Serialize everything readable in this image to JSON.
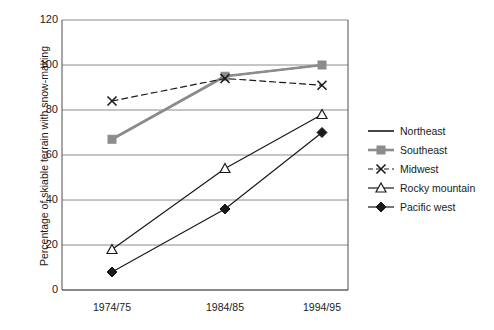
{
  "chart_data": {
    "type": "line",
    "title": "",
    "xlabel": "",
    "ylabel": "Percentage of skiable terrain with snow-making",
    "categories": [
      "1974/75",
      "1984/85",
      "1994/95"
    ],
    "ylim": [
      0,
      120
    ],
    "yticks": [
      0,
      20,
      40,
      60,
      80,
      100,
      120
    ],
    "grid": true,
    "legend_position": "right",
    "series": [
      {
        "name": "Northeast",
        "values": [
          67,
          95,
          100
        ],
        "color": "#1a1a1a",
        "style": "solid",
        "marker": "none",
        "width": 1.6
      },
      {
        "name": "Southeast",
        "values": [
          67,
          95,
          100
        ],
        "color": "#8c8c8c",
        "style": "solid",
        "marker": "square-filled",
        "width": 2.6
      },
      {
        "name": "Midwest",
        "values": [
          84,
          94,
          91
        ],
        "color": "#1a1a1a",
        "style": "dashed",
        "marker": "x",
        "width": 1.2
      },
      {
        "name": "Rocky mountain",
        "values": [
          18,
          54,
          78
        ],
        "color": "#1a1a1a",
        "style": "solid",
        "marker": "triangle-open",
        "width": 1.2
      },
      {
        "name": "Pacific west",
        "values": [
          8,
          36,
          70
        ],
        "color": "#1a1a1a",
        "style": "solid",
        "marker": "diamond-filled",
        "width": 1.2
      }
    ]
  },
  "legend": {
    "items": [
      {
        "label": "Northeast"
      },
      {
        "label": "Southeast"
      },
      {
        "label": "Midwest"
      },
      {
        "label": "Rocky mountain"
      },
      {
        "label": "Pacific west"
      }
    ]
  },
  "colors": {
    "axis": "#4d4d4d",
    "grid": "#8c8c8c",
    "text": "#1a1a1a",
    "background": "#ffffff",
    "series_gray": "#8c8c8c",
    "series_black": "#1a1a1a"
  }
}
